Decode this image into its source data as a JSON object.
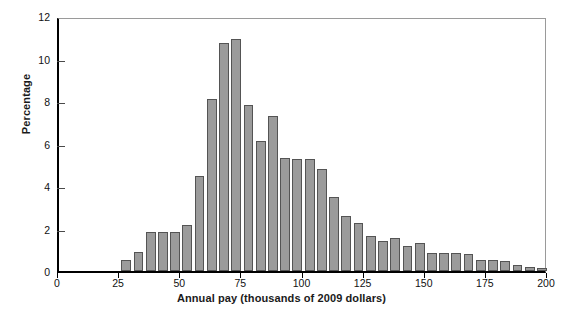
{
  "chart_data": {
    "type": "bar",
    "title": "",
    "subtitle": "",
    "xlabel": "Annual pay (thousands of 2009 dollars)",
    "ylabel": "Percentage",
    "xlim": [
      0,
      200
    ],
    "ylim": [
      0,
      12
    ],
    "xticks": [
      0,
      25,
      50,
      75,
      100,
      125,
      150,
      175,
      200
    ],
    "yticks": [
      0,
      2,
      4,
      6,
      8,
      10,
      12
    ],
    "grid": false,
    "legend": null,
    "bin_width": 5,
    "bar_color": "#9b9b9b",
    "bar_edge_color": "#545454",
    "axis_color": "#000000",
    "categories": [
      "27.5",
      "32.5",
      "37.5",
      "42.5",
      "47.5",
      "52.5",
      "57.5",
      "62.5",
      "67.5",
      "72.5",
      "77.5",
      "82.5",
      "87.5",
      "92.5",
      "97.5",
      "102.5",
      "107.5",
      "112.5",
      "117.5",
      "122.5",
      "127.5",
      "132.5",
      "137.5",
      "142.5",
      "147.5",
      "152.5",
      "157.5",
      "162.5",
      "167.5",
      "172.5",
      "177.5",
      "182.5",
      "187.5",
      "192.5",
      "197.5"
    ],
    "bins": [
      {
        "start": 25,
        "end": 30,
        "value": 0.5
      },
      {
        "start": 30,
        "end": 35,
        "value": 0.9
      },
      {
        "start": 35,
        "end": 40,
        "value": 1.85
      },
      {
        "start": 40,
        "end": 45,
        "value": 1.85
      },
      {
        "start": 45,
        "end": 50,
        "value": 1.85
      },
      {
        "start": 50,
        "end": 55,
        "value": 2.15
      },
      {
        "start": 55,
        "end": 60,
        "value": 4.45
      },
      {
        "start": 60,
        "end": 65,
        "value": 8.1
      },
      {
        "start": 65,
        "end": 70,
        "value": 10.75
      },
      {
        "start": 70,
        "end": 75,
        "value": 10.9
      },
      {
        "start": 75,
        "end": 80,
        "value": 7.8
      },
      {
        "start": 80,
        "end": 85,
        "value": 6.1
      },
      {
        "start": 85,
        "end": 90,
        "value": 7.3
      },
      {
        "start": 90,
        "end": 95,
        "value": 5.3
      },
      {
        "start": 95,
        "end": 100,
        "value": 5.25
      },
      {
        "start": 100,
        "end": 105,
        "value": 5.25
      },
      {
        "start": 105,
        "end": 110,
        "value": 4.8
      },
      {
        "start": 110,
        "end": 115,
        "value": 3.5
      },
      {
        "start": 115,
        "end": 120,
        "value": 2.6
      },
      {
        "start": 120,
        "end": 125,
        "value": 2.25
      },
      {
        "start": 125,
        "end": 130,
        "value": 1.65
      },
      {
        "start": 130,
        "end": 135,
        "value": 1.4
      },
      {
        "start": 135,
        "end": 140,
        "value": 1.55
      },
      {
        "start": 140,
        "end": 145,
        "value": 1.2
      },
      {
        "start": 145,
        "end": 150,
        "value": 1.3
      },
      {
        "start": 150,
        "end": 155,
        "value": 0.85
      },
      {
        "start": 155,
        "end": 160,
        "value": 0.85
      },
      {
        "start": 160,
        "end": 165,
        "value": 0.85
      },
      {
        "start": 165,
        "end": 170,
        "value": 0.8
      },
      {
        "start": 170,
        "end": 175,
        "value": 0.5
      },
      {
        "start": 175,
        "end": 180,
        "value": 0.5
      },
      {
        "start": 180,
        "end": 185,
        "value": 0.45
      },
      {
        "start": 185,
        "end": 190,
        "value": 0.3
      },
      {
        "start": 190,
        "end": 195,
        "value": 0.2
      },
      {
        "start": 195,
        "end": 200,
        "value": 0.15
      }
    ],
    "values": [
      0.5,
      0.9,
      1.85,
      1.85,
      1.85,
      2.15,
      4.45,
      8.1,
      10.75,
      10.9,
      7.8,
      6.1,
      7.3,
      5.3,
      5.25,
      5.25,
      4.8,
      3.5,
      2.6,
      2.25,
      1.65,
      1.4,
      1.55,
      1.2,
      1.3,
      0.85,
      0.85,
      0.85,
      0.8,
      0.5,
      0.5,
      0.45,
      0.3,
      0.2,
      0.15
    ]
  }
}
